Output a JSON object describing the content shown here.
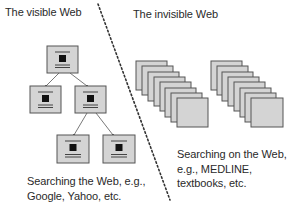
{
  "diagram": {
    "left_section": {
      "title": "The visible Web",
      "caption_lines": [
        "Searching the Web, e.g.,",
        "Google, Yahoo, etc."
      ],
      "tree": {
        "nodes": [
          {
            "id": "root",
            "x": 47,
            "y": 46
          },
          {
            "id": "left-child",
            "x": 30,
            "y": 86
          },
          {
            "id": "right-child",
            "x": 75,
            "y": 86
          },
          {
            "id": "right-left-grandchild",
            "x": 57,
            "y": 135
          },
          {
            "id": "right-right-grandchild",
            "x": 103,
            "y": 135
          }
        ],
        "edges": [
          {
            "from": "root",
            "to": "left-child"
          },
          {
            "from": "root",
            "to": "right-child"
          },
          {
            "from": "right-child",
            "to": "right-left-grandchild"
          },
          {
            "from": "right-child",
            "to": "right-right-grandchild"
          }
        ]
      }
    },
    "right_section": {
      "title": "The invisible Web",
      "caption_lines": [
        "Searching on the Web,",
        "e.g., MEDLINE,",
        "textbooks, etc."
      ],
      "stacks": [
        {
          "id": "stack-1",
          "back_x": 136,
          "back_y": 61,
          "pages": 8
        },
        {
          "id": "stack-2",
          "back_x": 211,
          "back_y": 61,
          "pages": 8
        }
      ]
    },
    "divider": {
      "style": "dotted",
      "x1": 98,
      "y1": 4,
      "x2": 170,
      "y2": 200
    },
    "colors": {
      "page_fill": "#d4d4d4",
      "page_stroke": "#555555",
      "glyph": "#111111",
      "divider": "#333333",
      "edge": "#555555",
      "text": "#2a2a2a"
    }
  }
}
